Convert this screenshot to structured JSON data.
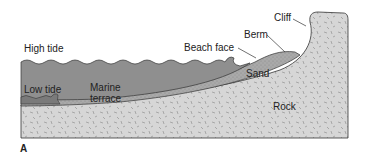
{
  "figure": {
    "panel_label": "A",
    "labels": {
      "high_tide": "High tide",
      "low_tide": "Low tide",
      "marine_terrace_line1": "Marine",
      "marine_terrace_line2": "terrace",
      "beach_face": "Beach face",
      "berm": "Berm",
      "cliff": "Cliff",
      "sand": "Sand",
      "rock": "Rock"
    },
    "colors": {
      "water": "#8f8f8f",
      "low_water": "#7a7a7a",
      "sand": "#a9a9a9",
      "rock": "#d6d6d6",
      "outline": "#333333",
      "background": "#ffffff"
    }
  }
}
